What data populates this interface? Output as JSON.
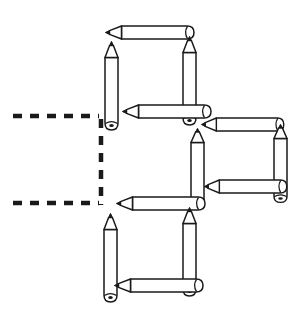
{
  "figure": {
    "background_color": "#ffffff",
    "ink_color": "#1a1a1a",
    "width": 300,
    "height": 319,
    "squares": [
      {
        "name": "top-left-square",
        "x": 103,
        "y": 27,
        "size": 92,
        "pencils": [
          {
            "name": "top-pencil",
            "orientation": "horizontal",
            "tip_direction": "left"
          },
          {
            "name": "left-pencil",
            "orientation": "vertical",
            "tip_direction": "up"
          },
          {
            "name": "right-pencil",
            "orientation": "vertical",
            "tip_direction": "up"
          },
          {
            "name": "bottom-pencil",
            "orientation": "horizontal",
            "tip_direction": "left"
          }
        ]
      },
      {
        "name": "middle-right-square",
        "x": 190,
        "y": 119,
        "size": 80,
        "pencils": [
          {
            "name": "top-pencil",
            "orientation": "horizontal",
            "tip_direction": "left"
          },
          {
            "name": "left-pencil",
            "orientation": "vertical",
            "tip_direction": "up"
          },
          {
            "name": "right-pencil",
            "orientation": "vertical",
            "tip_direction": "up"
          },
          {
            "name": "bottom-pencil",
            "orientation": "horizontal",
            "tip_direction": "left"
          }
        ]
      },
      {
        "name": "bottom-left-square",
        "x": 103,
        "y": 202,
        "size": 92,
        "pencils": [
          {
            "name": "top-pencil",
            "orientation": "horizontal",
            "tip_direction": "left"
          },
          {
            "name": "left-pencil",
            "orientation": "vertical",
            "tip_direction": "up"
          },
          {
            "name": "right-pencil",
            "orientation": "vertical",
            "tip_direction": "up"
          },
          {
            "name": "bottom-pencil",
            "orientation": "horizontal",
            "tip_direction": "left"
          }
        ]
      }
    ],
    "dashed_lines": [
      {
        "name": "upper-horizontal-dash",
        "x1": 13,
        "y1": 116,
        "x2": 101,
        "y2": 116,
        "dash": "9 8"
      },
      {
        "name": "vertical-dash",
        "x1": 101,
        "y1": 118,
        "x2": 101,
        "y2": 204,
        "dash": "9 8"
      },
      {
        "name": "lower-horizontal-dash",
        "x1": 13,
        "y1": 203,
        "x2": 101,
        "y2": 203,
        "dash": "9 8"
      }
    ]
  }
}
